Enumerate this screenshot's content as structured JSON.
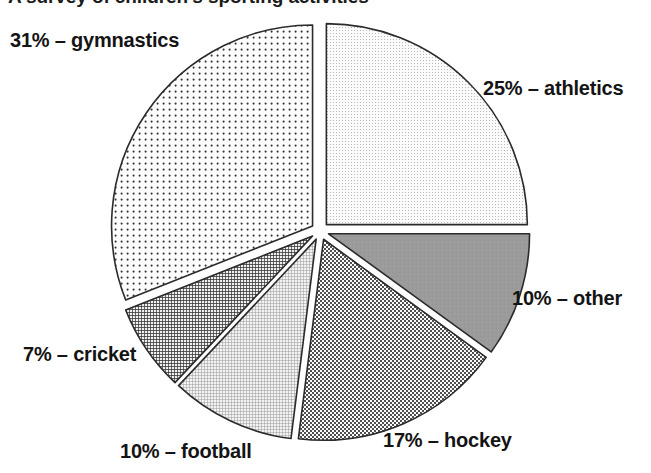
{
  "title": {
    "text": "A survey of children's sporting activities",
    "clipped": true
  },
  "chart_data": {
    "type": "pie",
    "title": "A survey of children's sporting activities",
    "xlabel": "",
    "ylabel": "",
    "exploded": true,
    "legend_position": "outside-labels",
    "grid": false,
    "start_angle_deg": 0,
    "direction": "clockwise",
    "units": "percent",
    "categories": [
      "athletics",
      "other",
      "hockey",
      "football",
      "cricket",
      "gymnastics"
    ],
    "values": [
      25,
      10,
      17,
      10,
      7,
      31
    ],
    "labels": [
      "25% – athletics",
      "10% – other",
      "17% – hockey",
      "10% – football",
      "7% – cricket",
      "31% – gymnastics"
    ],
    "slices": [
      {
        "name": "athletics",
        "value": 25,
        "label": "25% – athletics",
        "percent_text": "25%",
        "start_deg": 0,
        "end_deg": 90,
        "fill": "#f2f2f2",
        "pattern": "fine-dots-light",
        "stroke": "#2b2b2b"
      },
      {
        "name": "other",
        "value": 10,
        "label": "10% – other",
        "percent_text": "10%",
        "start_deg": 90,
        "end_deg": 126,
        "fill": "#9b9b9b",
        "pattern": "solid-gray",
        "stroke": "#2b2b2b"
      },
      {
        "name": "hockey",
        "value": 17,
        "label": "17% – hockey",
        "percent_text": "17%",
        "start_deg": 126,
        "end_deg": 187.2,
        "fill": "#e3e3e3",
        "pattern": "checker-dots-medium",
        "stroke": "#2b2b2b"
      },
      {
        "name": "football",
        "value": 10,
        "label": "10% – football",
        "percent_text": "10%",
        "start_deg": 187.2,
        "end_deg": 223.2,
        "fill": "#dcdcdc",
        "pattern": "fine-crosshatch-light",
        "stroke": "#2b2b2b"
      },
      {
        "name": "cricket",
        "value": 7,
        "label": "7% – cricket",
        "percent_text": "7%",
        "start_deg": 223.2,
        "end_deg": 248.4,
        "fill": "#6e6e6e",
        "pattern": "dense-crosshatch-dark",
        "stroke": "#2b2b2b"
      },
      {
        "name": "gymnastics",
        "value": 31,
        "label": "31% – gymnastics",
        "percent_text": "31%",
        "start_deg": 248.4,
        "end_deg": 360,
        "fill": "#f4f4f4",
        "pattern": "coarse-dot-grid",
        "stroke": "#2b2b2b"
      }
    ]
  },
  "colors": {
    "background": "#ffffff",
    "outline": "#2b2b2b",
    "text": "#141414",
    "other_slice_gray": "#9b9b9b",
    "cricket_slice_gray": "#6e6e6e"
  },
  "labels": {
    "gymnastics": "31% – gymnastics",
    "athletics": "25% – athletics",
    "other": "10% – other",
    "hockey": "17% – hockey",
    "football": "10% – football",
    "cricket": "7% – cricket"
  }
}
